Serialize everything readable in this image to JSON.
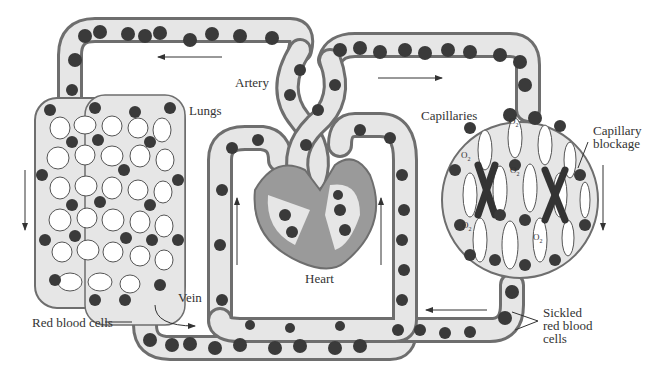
{
  "diagram": {
    "labels": {
      "artery": "Artery",
      "lungs": "Lungs",
      "capillaries": "Capillaries",
      "capillary_blockage_1": "Capillary",
      "capillary_blockage_2": "blockage",
      "heart": "Heart",
      "vein": "Vein",
      "red_blood_cells": "Red blood cells",
      "sickled_1": "Sickled",
      "sickled_2": "red blood",
      "sickled_3": "cells",
      "oxygen": "O",
      "oxygen_sub": "2"
    },
    "flow_arrows": [
      {
        "location": "top-left vessel",
        "direction": "left"
      },
      {
        "location": "top-right vessel",
        "direction": "right"
      },
      {
        "location": "left of lungs",
        "direction": "down"
      },
      {
        "location": "right of capillaries",
        "direction": "down"
      },
      {
        "location": "inside left loop",
        "direction": "up"
      },
      {
        "location": "inside right loop",
        "direction": "up"
      },
      {
        "location": "bottom-right vessel",
        "direction": "left"
      },
      {
        "location": "near vein",
        "direction": "right-curved"
      }
    ],
    "colors": {
      "vessel_wall": "#6e6e6e",
      "vessel_fill": "#e6e6e6",
      "cell": "#3a3a3a",
      "heart_muscle": "#9a9a9a",
      "text": "#333333"
    }
  }
}
